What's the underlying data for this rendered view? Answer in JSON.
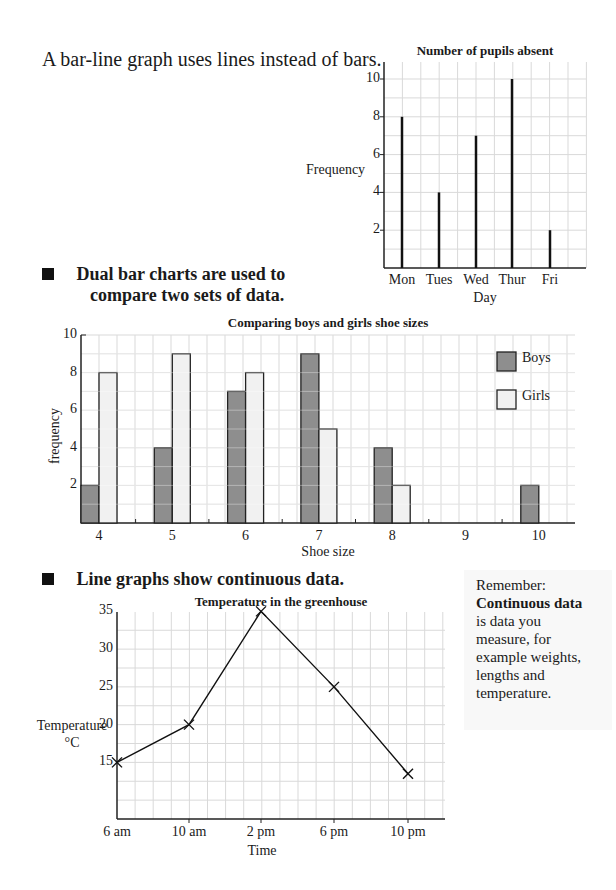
{
  "intro_text": "A bar-line graph uses lines instead of bars.",
  "bullets": [
    {
      "line1": "Dual bar charts are used to",
      "line2": "compare two sets of data."
    },
    {
      "line1": "Line graphs show continuous data."
    }
  ],
  "remember": {
    "heading": "Remember:",
    "bold": "Continuous data",
    "lines": [
      "is data you",
      "measure, for",
      "example weights,",
      "lengths and",
      "temperature."
    ]
  },
  "colors": {
    "boys": "#8e8e8e",
    "girls": "#f1f1f1",
    "grid": "#d9d9d9",
    "axis": "#222222"
  },
  "chart_data": [
    {
      "type": "bar",
      "subtype": "bar-line",
      "title": "Number of pupils absent",
      "xlabel": "Day",
      "ylabel": "Frequency",
      "categories": [
        "Mon",
        "Tues",
        "Wed",
        "Thur",
        "Fri"
      ],
      "values": [
        8,
        4,
        7,
        10,
        2
      ],
      "yticks": [
        2,
        4,
        6,
        8,
        10
      ],
      "ylim": [
        0,
        11
      ],
      "grid": true
    },
    {
      "type": "bar",
      "subtype": "dual",
      "title": "Comparing boys and girls shoe sizes",
      "xlabel": "Shoe size",
      "ylabel": "frequency",
      "categories": [
        "4",
        "5",
        "6",
        "7",
        "8",
        "9",
        "10"
      ],
      "series": [
        {
          "name": "Boys",
          "values": [
            2,
            4,
            7,
            9,
            4,
            0,
            2
          ]
        },
        {
          "name": "Girls",
          "values": [
            8,
            9,
            8,
            5,
            2,
            0,
            0
          ]
        }
      ],
      "yticks": [
        2,
        4,
        6,
        8,
        10
      ],
      "ylim": [
        0,
        10
      ],
      "legend": {
        "position": "upper right",
        "entries": [
          "Boys",
          "Girls"
        ]
      },
      "grid": true
    },
    {
      "type": "line",
      "title": "Temperature in the greenhouse",
      "xlabel": "Time",
      "ylabel": "Temperature °C",
      "ylabel_line1": "Temperature",
      "ylabel_line2": "°C",
      "categories": [
        "6 am",
        "10 am",
        "2 pm",
        "6 pm",
        "10 pm"
      ],
      "values": [
        15,
        20,
        35,
        25,
        13.5
      ],
      "yticks": [
        15,
        20,
        25,
        30,
        35
      ],
      "ylim": [
        10,
        37.5
      ],
      "marker": "x",
      "grid": true
    }
  ]
}
